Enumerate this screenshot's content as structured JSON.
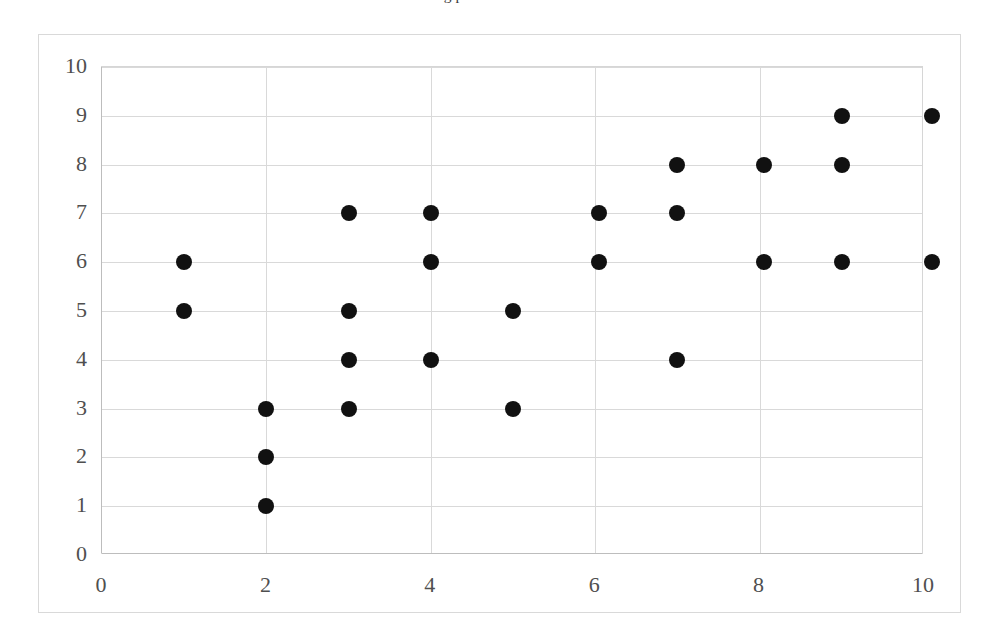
{
  "page": {
    "cropped_text_above": "g p  nt set as data."
  },
  "chart_data": {
    "type": "scatter",
    "title": "",
    "subtitle": "",
    "xlabel": "",
    "ylabel": "",
    "xlim": [
      0,
      10
    ],
    "ylim": [
      0,
      10
    ],
    "xticks": [
      0,
      2,
      4,
      6,
      8,
      10
    ],
    "yticks": [
      0,
      1,
      2,
      3,
      4,
      5,
      6,
      7,
      8,
      9,
      10
    ],
    "xtick_labels": [
      "0",
      "2",
      "4",
      "6",
      "8",
      "10"
    ],
    "ytick_labels": [
      "0",
      "1",
      "2",
      "3",
      "4",
      "5",
      "6",
      "7",
      "8",
      "9",
      "10"
    ],
    "grid": true,
    "grid_color": "#d9d9d9",
    "legend": false,
    "legend_position": "none",
    "marker": "circle",
    "marker_color": "#111111",
    "marker_size_px": 16,
    "point_count": 25,
    "series": [
      {
        "name": "",
        "points": [
          {
            "x": 1,
            "y": 6.0
          },
          {
            "x": 1,
            "y": 5.0
          },
          {
            "x": 2,
            "y": 3.0
          },
          {
            "x": 2,
            "y": 2.0
          },
          {
            "x": 2,
            "y": 1.0
          },
          {
            "x": 3,
            "y": 7.0
          },
          {
            "x": 3,
            "y": 5.0
          },
          {
            "x": 3,
            "y": 4.0
          },
          {
            "x": 3,
            "y": 3.0
          },
          {
            "x": 4,
            "y": 7.0
          },
          {
            "x": 4,
            "y": 6.0
          },
          {
            "x": 4,
            "y": 4.0
          },
          {
            "x": 5,
            "y": 5.0
          },
          {
            "x": 5,
            "y": 3.0
          },
          {
            "x": 6.05,
            "y": 7.0
          },
          {
            "x": 6.05,
            "y": 6.0
          },
          {
            "x": 7,
            "y": 8.0
          },
          {
            "x": 7,
            "y": 7.0
          },
          {
            "x": 7,
            "y": 4.0
          },
          {
            "x": 8.05,
            "y": 8.0
          },
          {
            "x": 8.05,
            "y": 6.0
          },
          {
            "x": 9,
            "y": 9.0
          },
          {
            "x": 9,
            "y": 8.0
          },
          {
            "x": 9,
            "y": 6.0
          },
          {
            "x": 10.1,
            "y": 9.0
          },
          {
            "x": 10.1,
            "y": 6.0
          }
        ]
      }
    ]
  }
}
